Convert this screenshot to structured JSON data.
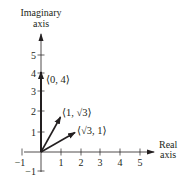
{
  "diagram": {
    "type": "complex-plane-vectors",
    "y_axis": {
      "label_line1": "Imaginary",
      "label_line2": "axis",
      "ticks": [
        "5",
        "4",
        "3",
        "2",
        "1",
        "−1"
      ]
    },
    "x_axis": {
      "label_line1": "Real",
      "label_line2": "axis",
      "ticks": [
        "−1",
        "1",
        "2",
        "3",
        "4",
        "5"
      ]
    },
    "vectors": [
      {
        "name": "vector-0-4",
        "label": "⟨0, 4⟩",
        "x": 0,
        "y": 4
      },
      {
        "name": "vector-1-sqrt3",
        "label": "⟨1, √3⟩",
        "x": 1,
        "y": 1.732
      },
      {
        "name": "vector-sqrt3-1",
        "label": "⟨√3, 1⟩",
        "x": 1.732,
        "y": 1
      }
    ],
    "colors": {
      "ink": "#231f20",
      "background": "#ffffff"
    }
  }
}
